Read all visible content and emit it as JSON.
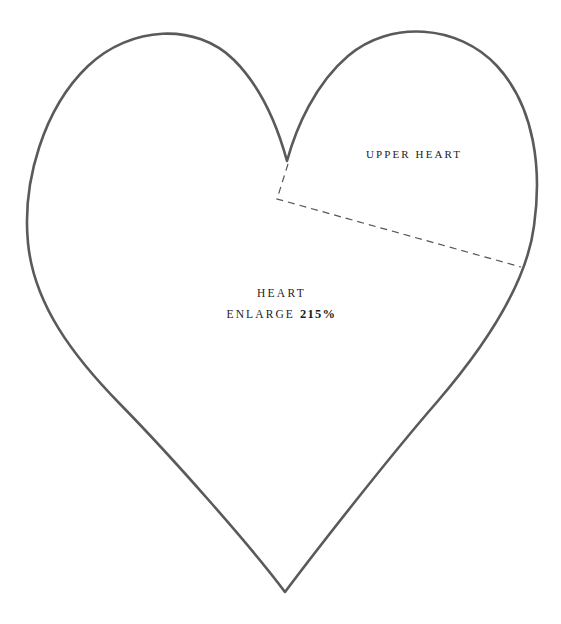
{
  "document": {
    "type": "sewing-pattern-template",
    "title": "Heart pattern template",
    "background_color": "#ffffff"
  },
  "shape": {
    "name": "heart-outline",
    "stroke_color": "#5a5a5a",
    "stroke_width": 2.6,
    "fill": "none"
  },
  "cut_line": {
    "name": "upper-heart-cut-line",
    "style": "dashed",
    "stroke_color": "#555555",
    "stroke_width": 1.2,
    "dash_pattern": "7 5"
  },
  "labels": {
    "upper_heart": "Upper Heart",
    "heart_name": "Heart",
    "enlarge_prefix": "Enlarge",
    "enlarge_value": "215%"
  }
}
